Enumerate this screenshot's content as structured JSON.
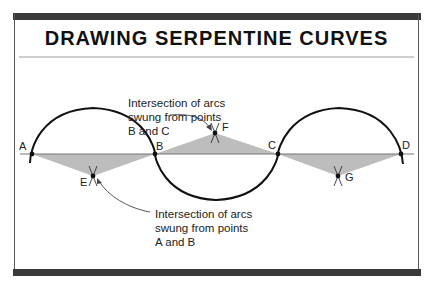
{
  "title": "DRAWING SERPENTINE CURVES",
  "points": {
    "A": "A",
    "B": "B",
    "C": "C",
    "D": "D",
    "E": "E",
    "F": "F",
    "G": "G"
  },
  "annotations": {
    "top": {
      "line1": "Intersection of arcs",
      "line2": "swung from points",
      "line3": "B and C"
    },
    "bottom": {
      "line1": "Intersection of arcs",
      "line2": "swung from points",
      "line3": "A and B"
    }
  },
  "colors": {
    "frame_bar": "#3a3a3a",
    "curve": "#111111",
    "triangle_fill": "#bdbdbd",
    "baseline": "#777777"
  }
}
